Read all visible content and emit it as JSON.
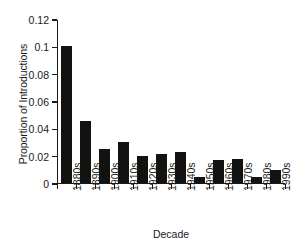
{
  "chart_data": {
    "type": "bar",
    "title": "",
    "subtitle": "",
    "xlabel": "Decade",
    "ylabel": "Proportion of Introductions",
    "categories": [
      "1880s",
      "1890s",
      "1900s",
      "1910s",
      "1920s",
      "1930s",
      "1940s",
      "1950s",
      "1960s",
      "1970s",
      "1980s",
      "1990s"
    ],
    "values": [
      0.1,
      0.045,
      0.025,
      0.03,
      0.0195,
      0.021,
      0.0225,
      0.0045,
      0.0165,
      0.0175,
      0.0045,
      0.0095
    ],
    "series": [
      {
        "name": "Proportion of Introductions",
        "values": [
          0.1,
          0.045,
          0.025,
          0.03,
          0.0195,
          0.021,
          0.0225,
          0.0045,
          0.0165,
          0.0175,
          0.0045,
          0.0095
        ]
      }
    ],
    "ylim": [
      0,
      0.12
    ],
    "yticks": [
      0,
      0.02,
      0.04,
      0.06,
      0.08,
      0.1,
      0.12
    ],
    "ytick_labels": [
      "0",
      "0.02",
      "0.04",
      "0.06",
      "0.08",
      "0.1",
      "0.12"
    ],
    "xtick_labels": [
      "1880s",
      "1890s",
      "1900s",
      "1910s",
      "1920s",
      "1930s",
      "1940s",
      "1950s",
      "1960s",
      "1970s",
      "1980s",
      "1990s"
    ],
    "xtick_label_rotation": -90,
    "grid": false,
    "legend": null,
    "legend_position": "none",
    "bar_color": "#121212",
    "axis_color": "#1a1a1a",
    "background_color": "#ffffff",
    "spines": [
      "left",
      "bottom"
    ],
    "annotations": []
  }
}
